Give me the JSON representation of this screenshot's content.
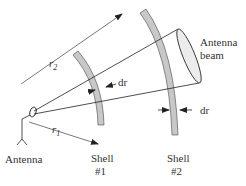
{
  "diagram": {
    "labels": {
      "r2": "r",
      "r2_sub": "2",
      "r1": "r",
      "r1_sub": "1",
      "dr_shell1": "dr",
      "dr_shell2": "dr",
      "antenna_beam_line1": "Antenna",
      "antenna_beam_line2": "beam",
      "antenna": "Antenna",
      "shell1_line1": "Shell",
      "shell1_line2": "#1",
      "shell2_line1": "Shell",
      "shell2_line2": "#2"
    },
    "colors": {
      "line": "#222222",
      "shell_fill": "#c8c8c8",
      "text": "#333333"
    }
  }
}
